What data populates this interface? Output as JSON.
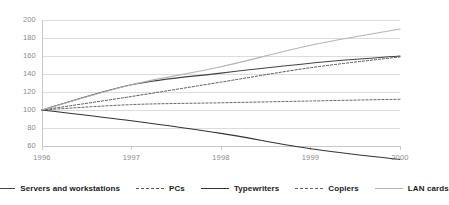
{
  "chart_data": {
    "type": "line",
    "title": "",
    "subtitle": "",
    "xlabel": "",
    "ylabel": "",
    "x": [
      1996,
      1997,
      1998,
      1999,
      2000
    ],
    "categories": [
      "1996",
      "1997",
      "1998",
      "1999",
      "2000"
    ],
    "xtick_labels": [
      "1996",
      "1997",
      "1998",
      "1999",
      "2000"
    ],
    "ytick_labels": [
      "200",
      "180",
      "160",
      "140",
      "120",
      "100",
      "80",
      "60"
    ],
    "ytick_values": [
      200,
      180,
      160,
      140,
      120,
      100,
      80,
      60
    ],
    "ylim": [
      60,
      200
    ],
    "xlim": [
      1996,
      2000
    ],
    "grid": "horizontal",
    "legend_position": "bottom",
    "series": [
      {
        "name": "Servers and workstations",
        "values": [
          100,
          128,
          141,
          152,
          160
        ],
        "style": "solid",
        "color": "#444444",
        "width": 1.1
      },
      {
        "name": "PCs",
        "values": [
          100,
          115,
          131,
          147,
          159
        ],
        "style": "dashed",
        "color": "#555555",
        "width": 1.0
      },
      {
        "name": "Typewriters",
        "values": [
          100,
          88,
          74,
          57,
          45
        ],
        "style": "solid",
        "color": "#333333",
        "width": 1.1
      },
      {
        "name": "Copiers",
        "values": [
          100,
          106,
          108,
          110,
          112
        ],
        "style": "dashed",
        "color": "#666666",
        "width": 1.0
      },
      {
        "name": "LAN cards",
        "values": [
          100,
          128,
          148,
          172,
          190
        ],
        "style": "solid",
        "color": "#b4b4b4",
        "width": 1.1
      }
    ],
    "axis_color": "#c8c8c8",
    "grid_color": "#dcdcdc",
    "tick_text_color": "#8a8a8a",
    "legend_text_color": "#1a1a1a",
    "background": "#ffffff"
  },
  "legend": {
    "items": [
      {
        "label": "Servers and workstations"
      },
      {
        "label": "PCs"
      },
      {
        "label": "Typewriters"
      },
      {
        "label": "Copiers"
      },
      {
        "label": "LAN cards"
      }
    ]
  }
}
